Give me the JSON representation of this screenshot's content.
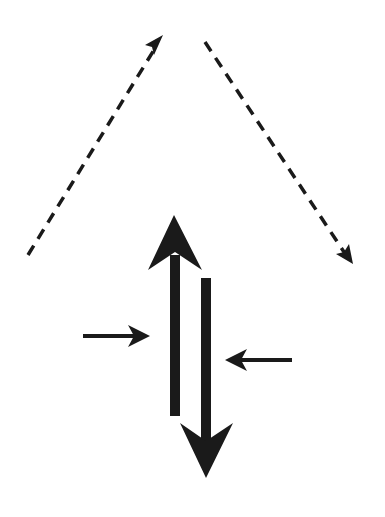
{
  "diagram": {
    "title": "",
    "background": "#ffffff",
    "ink_color": "#1a1a1a",
    "elements": {
      "dashed_left": {
        "type": "dashed-arrow",
        "direction": "up-right",
        "x1": 28,
        "y1": 255,
        "x2": 160,
        "y2": 40
      },
      "dashed_right": {
        "type": "dashed-arrow",
        "direction": "down-right",
        "x1": 205,
        "y1": 42,
        "x2": 349,
        "y2": 258
      },
      "thick_up": {
        "type": "thick-arrow",
        "direction": "up",
        "label": ""
      },
      "thick_down": {
        "type": "thick-arrow",
        "direction": "down",
        "label": ""
      },
      "small_right": {
        "type": "thin-arrow",
        "direction": "right",
        "label": ""
      },
      "small_left": {
        "type": "thin-arrow",
        "direction": "left",
        "label": ""
      }
    }
  }
}
